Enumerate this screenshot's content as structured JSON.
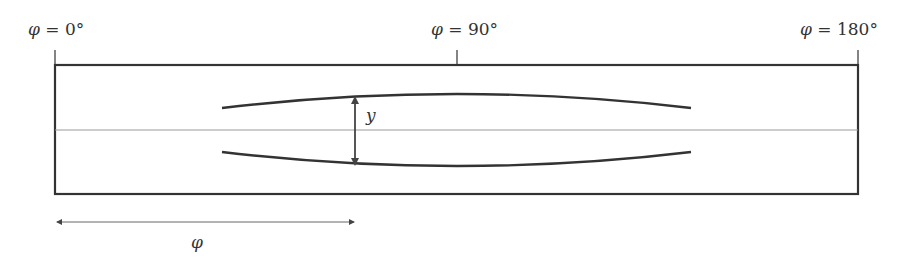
{
  "labels": {
    "phi_symbol": "φ",
    "left": {
      "sym": "φ",
      "rest": " = 0°"
    },
    "middle": {
      "sym": "φ",
      "rest": " = 90°"
    },
    "right": {
      "sym": "φ",
      "rest": " = 180°"
    },
    "gap": "y",
    "arc": "φ"
  },
  "colors": {
    "stroke": "#333333",
    "midline": "#999999",
    "arrow": "#555555"
  }
}
